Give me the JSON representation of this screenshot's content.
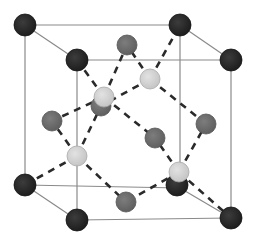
{
  "diagram": {
    "type": "crystal-unit-cell",
    "colors": {
      "background": "#ffffff",
      "cube_edge": "#8a8a8a",
      "bond": "#2a2a2a",
      "corner_atom": "#262626",
      "face_atom": "#6e6e6e",
      "tetra_atom": "#d2d2d2"
    },
    "cube": {
      "back": [
        [
          25,
          25
        ],
        [
          180,
          25
        ],
        [
          180,
          188
        ],
        [
          25,
          185
        ]
      ],
      "front": [
        [
          77,
          60
        ],
        [
          231,
          60
        ],
        [
          231,
          218
        ],
        [
          77,
          220
        ]
      ]
    },
    "atoms": [
      {
        "kind": "corner",
        "x": 25,
        "y": 25,
        "r": 11
      },
      {
        "kind": "corner",
        "x": 180,
        "y": 25,
        "r": 11
      },
      {
        "kind": "corner",
        "x": 25,
        "y": 185,
        "r": 11
      },
      {
        "kind": "corner",
        "x": 177,
        "y": 185,
        "r": 11
      },
      {
        "kind": "face",
        "x": 127,
        "y": 45,
        "r": 10
      },
      {
        "kind": "face",
        "x": 101,
        "y": 106,
        "r": 10
      },
      {
        "kind": "face",
        "x": 52,
        "y": 121,
        "r": 10
      },
      {
        "kind": "face",
        "x": 206,
        "y": 124,
        "r": 10
      },
      {
        "kind": "face",
        "x": 155,
        "y": 138,
        "r": 10
      },
      {
        "kind": "face",
        "x": 126,
        "y": 202,
        "r": 10
      },
      {
        "kind": "corner",
        "x": 77,
        "y": 60,
        "r": 11
      },
      {
        "kind": "corner",
        "x": 231,
        "y": 60,
        "r": 11
      },
      {
        "kind": "corner",
        "x": 77,
        "y": 220,
        "r": 11
      },
      {
        "kind": "corner",
        "x": 231,
        "y": 218,
        "r": 11
      },
      {
        "kind": "tetra",
        "x": 104,
        "y": 97,
        "r": 10
      },
      {
        "kind": "tetra",
        "x": 150,
        "y": 79,
        "r": 10
      },
      {
        "kind": "tetra",
        "x": 77,
        "y": 156,
        "r": 10
      },
      {
        "kind": "tetra",
        "x": 179,
        "y": 172,
        "r": 10
      }
    ],
    "bonds": [
      [
        104,
        97,
        77,
        60
      ],
      [
        104,
        97,
        127,
        45
      ],
      [
        104,
        97,
        52,
        121
      ],
      [
        104,
        97,
        155,
        138
      ],
      [
        150,
        79,
        127,
        45
      ],
      [
        150,
        79,
        180,
        25
      ],
      [
        150,
        79,
        206,
        124
      ],
      [
        150,
        79,
        101,
        106
      ],
      [
        77,
        156,
        52,
        121
      ],
      [
        77,
        156,
        101,
        106
      ],
      [
        77,
        156,
        25,
        185
      ],
      [
        77,
        156,
        126,
        202
      ],
      [
        179,
        172,
        155,
        138
      ],
      [
        179,
        172,
        206,
        124
      ],
      [
        179,
        172,
        126,
        202
      ],
      [
        179,
        172,
        231,
        218
      ]
    ]
  }
}
